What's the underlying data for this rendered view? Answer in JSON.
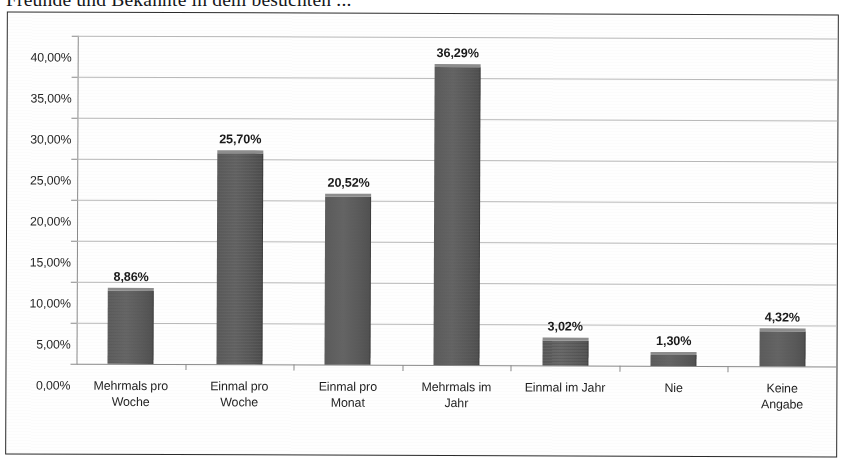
{
  "document": {
    "title_line": "Freunde und Bekannte in dem besuchten ..."
  },
  "chart_data": {
    "type": "bar",
    "title": "",
    "xlabel": "",
    "ylabel": "",
    "ylim": [
      0,
      40
    ],
    "ytick_labels": [
      "40,00%",
      "35,00%",
      "30,00%",
      "25,00%",
      "20,00%",
      "15,00%",
      "10,00%",
      "5,00%",
      "0,00%"
    ],
    "ytick_values": [
      40,
      35,
      30,
      25,
      20,
      15,
      10,
      5,
      0
    ],
    "grid": true,
    "legend": false,
    "categories": [
      "Mehrmals pro\nWoche",
      "Einmal pro\nWoche",
      "Einmal pro\nMonat",
      "Mehrmals im\nJahr",
      "Einmal im Jahr",
      "Nie",
      "Keine Angabe"
    ],
    "values": [
      8.86,
      25.7,
      20.52,
      36.29,
      3.02,
      1.3,
      4.32
    ],
    "value_labels": [
      "8,86%",
      "25,70%",
      "20,52%",
      "36,29%",
      "3,02%",
      "1,30%",
      "4,32%"
    ],
    "colors": {
      "bar_fill": "#5d5d5d",
      "bar_top": "#8d8d8d",
      "gridline": "#b9b9b9",
      "axis": "#8a8a8a",
      "frame": "#2b2b2b",
      "background": "#fefefe",
      "text": "#1f1f1f"
    }
  }
}
